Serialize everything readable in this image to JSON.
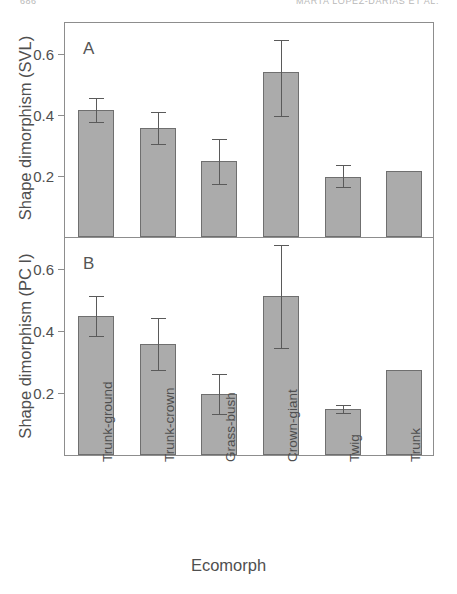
{
  "running_head": {
    "left": "686",
    "right": "MARTA LOPEZ-DARIAS ET AL."
  },
  "chart_data": {
    "type": "bar",
    "title": "",
    "xlabel": "Ecomorph",
    "categories": [
      "Trunk-ground",
      "Trunk-crown",
      "Grass-bush",
      "Crown-giant",
      "Twig",
      "Trunk"
    ],
    "panels": [
      {
        "letter": "A",
        "ylabel": "Shape dimorphism (SVL)",
        "ylim": [
          0.0,
          0.7
        ],
        "yticks": [
          0.2,
          0.4,
          0.6
        ],
        "ytick_labels": [
          "0.2",
          "0.4",
          "0.6"
        ],
        "grid": false,
        "values": [
          0.415,
          0.357,
          0.25,
          0.54,
          0.197,
          0.215
        ],
        "err_low": [
          0.375,
          0.305,
          0.173,
          0.395,
          0.163,
          null
        ],
        "err_high": [
          0.455,
          0.41,
          0.322,
          0.645,
          0.235,
          null
        ]
      },
      {
        "letter": "B",
        "ylabel": "Shape dimorphism (PC I)",
        "ylim": [
          0.0,
          0.7
        ],
        "yticks": [
          0.2,
          0.4,
          0.6
        ],
        "ytick_labels": [
          "0.2",
          "0.4",
          "0.6"
        ],
        "grid": false,
        "values": [
          0.447,
          0.357,
          0.197,
          0.512,
          0.147,
          0.275
        ],
        "err_low": [
          0.383,
          0.273,
          0.133,
          0.345,
          0.137,
          null
        ],
        "err_high": [
          0.512,
          0.443,
          0.262,
          0.678,
          0.16,
          null
        ]
      }
    ]
  },
  "colors": {
    "bar_fill": "#ababab",
    "bar_stroke": "#6f6f6f",
    "axis": "#8d8d8d",
    "text": "#4f4f4f"
  }
}
